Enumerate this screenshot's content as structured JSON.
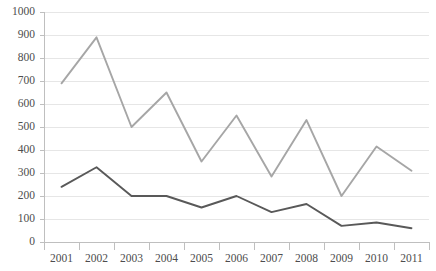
{
  "chart_data": {
    "type": "line",
    "title": "",
    "xlabel": "",
    "ylabel": "",
    "categories": [
      "2001",
      "2002",
      "2003",
      "2004",
      "2005",
      "2006",
      "2007",
      "2008",
      "2009",
      "2010",
      "2011"
    ],
    "ylim": [
      0,
      1000
    ],
    "ytick_values": [
      0,
      100,
      200,
      300,
      400,
      500,
      600,
      700,
      800,
      900,
      1000
    ],
    "ytick_labels": [
      "0",
      "100",
      "200",
      "300",
      "400",
      "500",
      "600",
      "700",
      "800",
      "900",
      "1000"
    ],
    "grid": true,
    "grid_axis": "y",
    "legend": false,
    "series": [
      {
        "name": "series-light",
        "color": "#a6a6a6",
        "values": [
          690,
          890,
          500,
          650,
          350,
          550,
          285,
          530,
          200,
          415,
          310
        ]
      },
      {
        "name": "series-dark",
        "color": "#595959",
        "values": [
          240,
          325,
          200,
          200,
          150,
          200,
          130,
          165,
          70,
          85,
          60
        ]
      }
    ],
    "colors": {
      "grid": "#e6e6e6",
      "axis": "#bfbfbf",
      "tick_text": "#4d4d4d",
      "background": "#ffffff"
    }
  }
}
